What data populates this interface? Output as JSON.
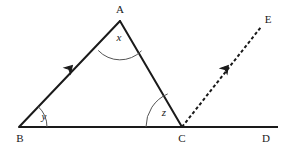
{
  "figure": {
    "background_color": "#ffffff",
    "stroke_color": "#1a1a1a",
    "arc_color": "#555555",
    "width": 285,
    "height": 145
  },
  "points": {
    "A": {
      "label": "A",
      "x": 120,
      "y": 21,
      "label_x": 120,
      "label_y": 9
    },
    "B": {
      "label": "B",
      "x": 19,
      "y": 127,
      "label_x": 20,
      "label_y": 138
    },
    "C": {
      "label": "C",
      "x": 182,
      "y": 127,
      "label_x": 182,
      "label_y": 138
    },
    "D": {
      "label": "D",
      "x": 278,
      "y": 127,
      "label_x": 266,
      "label_y": 138
    },
    "E": {
      "label": "E",
      "x": 261,
      "y": 27,
      "label_x": 268,
      "label_y": 19
    }
  },
  "segments": [
    {
      "name": "baseline-bd",
      "from": "B",
      "to": "D",
      "style": "solid",
      "width": 2
    },
    {
      "name": "side-ba",
      "from": "B",
      "to": "A",
      "style": "solid",
      "width": 2,
      "arrow_marker": true
    },
    {
      "name": "side-ac",
      "from": "A",
      "to": "C",
      "style": "solid",
      "width": 2
    },
    {
      "name": "ray-ce",
      "from": "C",
      "to": "E",
      "style": "dashed",
      "width": 2,
      "arrow_marker": true
    }
  ],
  "arrow_markers": [
    {
      "name": "arrow-marker-ba",
      "x": 72,
      "y": 66,
      "angle_deg": -46.4
    },
    {
      "name": "arrow-marker-ce",
      "x": 228,
      "y": 66,
      "angle_deg": -50.3
    }
  ],
  "angles": [
    {
      "name": "angle-x",
      "label": "x",
      "vertex": "A",
      "label_x": 119,
      "label_y": 37,
      "arc_radius": 30
    },
    {
      "name": "angle-y",
      "label": "y",
      "vertex": "B",
      "label_x": 44,
      "label_y": 116,
      "arc_radius": 28
    },
    {
      "name": "angle-z",
      "label": "z",
      "vertex": "C",
      "label_x": 164,
      "label_y": 112,
      "arc_radius": 36
    }
  ],
  "arcs": {
    "x": {
      "d": "M 98.2 50.4 A 30 30 0 0 0 141.5 50.8"
    },
    "y": {
      "d": "M 47 127 A 28 28 0 0 0 38.1 106.5"
    },
    "z": {
      "d": "M 146 127 A 36 36 0 0 1 167.7 93.9"
    }
  }
}
